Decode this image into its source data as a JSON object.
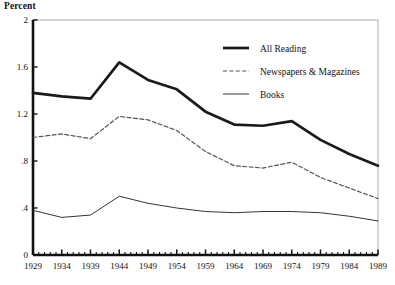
{
  "chart_data": {
    "type": "line",
    "title": "",
    "ylabel": "Percent",
    "xlabel": "",
    "x": [
      1929,
      1934,
      1939,
      1944,
      1949,
      1954,
      1959,
      1964,
      1969,
      1974,
      1979,
      1984,
      1989
    ],
    "xtick_labels": [
      "1929",
      "1934",
      "1939",
      "1944",
      "1949",
      "1954",
      "1959",
      "1964",
      "1969",
      "1974",
      "1979",
      "1984",
      "1989"
    ],
    "ytick_labels": [
      "0",
      ".4",
      ".8",
      "1.2",
      "1.6",
      "2"
    ],
    "ytick_values": [
      0,
      0.4,
      0.8,
      1.2,
      1.6,
      2
    ],
    "xlim": [
      1929,
      1989
    ],
    "ylim": [
      0,
      2
    ],
    "grid": false,
    "legend_position": "top-right",
    "minor_xticks_every": 1,
    "series": [
      {
        "name": "All Reading",
        "style": "solid-thick",
        "color": "#1a1a1a",
        "values": [
          1.38,
          1.35,
          1.33,
          1.64,
          1.49,
          1.41,
          1.22,
          1.11,
          1.1,
          1.14,
          0.98,
          0.86,
          0.76
        ]
      },
      {
        "name": "Newspapers & Magazines",
        "style": "dashed",
        "color": "#555555",
        "values": [
          1.0,
          1.03,
          0.99,
          1.18,
          1.15,
          1.06,
          0.88,
          0.76,
          0.74,
          0.79,
          0.66,
          0.57,
          0.48
        ]
      },
      {
        "name": "Books",
        "style": "solid-thin",
        "color": "#333333",
        "values": [
          0.38,
          0.32,
          0.34,
          0.5,
          0.44,
          0.4,
          0.37,
          0.36,
          0.37,
          0.37,
          0.36,
          0.33,
          0.29
        ]
      }
    ]
  },
  "legend": {
    "items": [
      {
        "label": "All Reading"
      },
      {
        "label": "Newspapers & Magazines"
      },
      {
        "label": "Books"
      }
    ]
  }
}
